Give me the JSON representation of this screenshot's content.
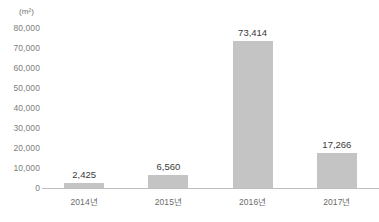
{
  "chart_data": {
    "type": "bar",
    "title": "",
    "subtitle": "",
    "unit_label": "(m²)",
    "xlabel": "",
    "ylabel": "",
    "categories": [
      "2014년",
      "2015년",
      "2016년",
      "2017년"
    ],
    "values": [
      2425,
      6560,
      73414,
      17266
    ],
    "value_labels": [
      "2,425",
      "6,560",
      "73,414",
      "17,266"
    ],
    "ylim": [
      0,
      80000
    ],
    "ytick_values": [
      0,
      10000,
      20000,
      30000,
      40000,
      50000,
      60000,
      70000,
      80000
    ],
    "ytick_labels": [
      "0",
      "10,000",
      "20,000",
      "30,000",
      "40,000",
      "50,000",
      "60,000",
      "70,000",
      "80,000"
    ],
    "grid": false,
    "legend": null,
    "legend_position": "none",
    "series": [
      {
        "name": "",
        "values": [
          2425,
          6560,
          73414,
          17266
        ]
      }
    ],
    "colors": {
      "bar_fill": "#c4c4c4",
      "axis_line": "#bdbdbd",
      "tick_text": "#7d7d7d",
      "value_text": "#3a3a3a",
      "category_text": "#6b6b6b",
      "background": "#ffffff"
    }
  }
}
